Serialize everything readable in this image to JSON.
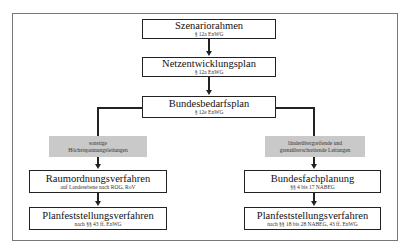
{
  "diagram": {
    "top_boxes": [
      {
        "title": "Szenariorahmen",
        "subtitle": "§ 12a EnWG"
      },
      {
        "title": "Netzentwicklungsplan",
        "subtitle": "§ 12a EnWG"
      },
      {
        "title": "Bundesbedarfsplan",
        "subtitle": "§ 12e EnWG"
      }
    ],
    "left_branch": {
      "category_line1": "sonstige",
      "category_line2": "Höchstspannungsleitungen",
      "boxes": [
        {
          "title": "Raumordnungsverfahren",
          "subtitle": "auf Landesebene nach ROG, RoV"
        },
        {
          "title": "Planfeststellungsverfahren",
          "subtitle": "nach §§ 43 ff. EnWG"
        }
      ]
    },
    "right_branch": {
      "category_line1": "länderübergreifende und",
      "category_line2": "grenzüberschreitende Leitungen",
      "boxes": [
        {
          "title": "Bundesfachplanung",
          "subtitle": "§§ 4 bis 17 NABEG"
        },
        {
          "title": "Planfeststellungsverfahren",
          "subtitle": "nach §§ 18 bis 28 NABEG, 43 ff. EnWG"
        }
      ]
    },
    "colors": {
      "box_border": "#222222",
      "category_fill": "#c9c9c9",
      "frame_border": "#777777"
    }
  }
}
